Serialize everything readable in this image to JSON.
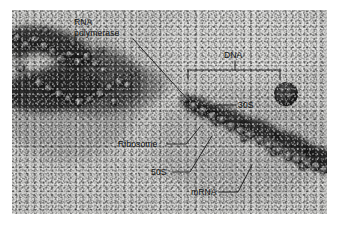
{
  "figure": {
    "kind": "electron-micrograph",
    "plate": {
      "background_color": "#c9c9c7",
      "ink_color": "#121212",
      "margin_color": "#ffffff"
    }
  },
  "labels": {
    "rna_polymerase_line1": "RNA",
    "rna_polymerase_line2": "polymerase",
    "dna": "DNA",
    "thirty_s": "30S",
    "ribosome": "Ribosome",
    "fifty_s": "50S",
    "mrna": "mRNA"
  },
  "annotations": [
    {
      "name": "rna-polymerase",
      "text": "RNA polymerase",
      "leader": "diagonal down-right to dark particle",
      "target_x": 190,
      "target_y": 102
    },
    {
      "name": "dna",
      "text": "DNA",
      "leader": "bracket spanning template strand",
      "bracket_x1": 188,
      "bracket_x2": 280,
      "bracket_y": 70
    },
    {
      "name": "30s",
      "text": "30S",
      "leader": "short hook down-left to ribosome subunit",
      "target_x": 190,
      "target_y": 108
    },
    {
      "name": "ribosome",
      "text": "Ribosome",
      "leader": "horizontal then diagonal up-right",
      "target_x": 196,
      "target_y": 118
    },
    {
      "name": "50s",
      "text": "50S",
      "leader": "horizontal then diagonal up-right",
      "target_x": 207,
      "target_y": 122
    },
    {
      "name": "mrna",
      "text": "mRNA",
      "leader": "horizontal then diagonal up-right",
      "target_x": 248,
      "target_y": 146
    }
  ]
}
